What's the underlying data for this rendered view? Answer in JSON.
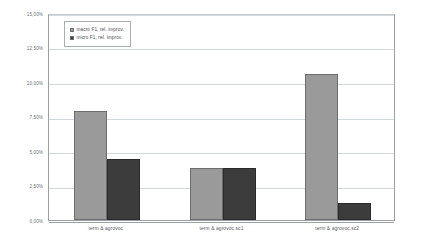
{
  "chart_data": {
    "type": "bar",
    "title": "",
    "subtitle": "",
    "xlabel": "",
    "ylabel": "",
    "ylim": [
      0,
      15
    ],
    "ytick_labels": [
      "15,00%",
      "12,50%",
      "10,00%",
      "7,50%",
      "5,00%",
      "2,50%",
      "0,00%"
    ],
    "ytick_values": [
      15.0,
      12.5,
      10.0,
      7.5,
      5.0,
      2.5,
      0.0
    ],
    "grid": true,
    "legend_position": "top-left",
    "categories": [
      "term & agrovoc",
      "term & agrovoc.sc1",
      "term & agrovoc.sc2"
    ],
    "series": [
      {
        "name": "macro F1, rel. improv.",
        "color": "#9a9a9a",
        "values": [
          7.9,
          3.8,
          10.6
        ]
      },
      {
        "name": "micro F1, rel. improv.",
        "color": "#3c3c3c",
        "values": [
          4.4,
          3.75,
          1.25
        ]
      }
    ],
    "value_unit": "%",
    "colors": {
      "plot_background": "#ffffff",
      "gridline": "#d3d8dd",
      "axis": "#9aa0a6",
      "tick_text": "#6b7075",
      "legend_border": "#a8adb2"
    }
  }
}
